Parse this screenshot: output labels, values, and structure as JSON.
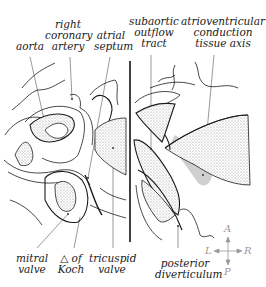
{
  "figure": {
    "type": "anatomical-diagram",
    "labels": [
      {
        "id": "aorta",
        "text": "aorta"
      },
      {
        "id": "right-coronary-artery",
        "text": "right\ncoronary\nartery"
      },
      {
        "id": "atrial-septum",
        "text": "atrial\nseptum"
      },
      {
        "id": "subaortic-outflow-tract",
        "text": "subaortic\noutflow\ntract"
      },
      {
        "id": "av-conduction-tissue-axis",
        "text": "atrioventricular\nconduction\ntissue axis"
      },
      {
        "id": "mitral-valve",
        "text": "mitral\nvalve"
      },
      {
        "id": "triangle-of-koch",
        "text": "△ of\nKoch"
      },
      {
        "id": "tricuspid-valve",
        "text": "tricuspid\nvalve"
      },
      {
        "id": "posterior-diverticulum",
        "text": "posterior\ndiverticulum"
      }
    ],
    "compass": {
      "anterior": "A",
      "posterior": "P",
      "left": "L",
      "right": "R"
    },
    "colors": {
      "line": "#1a1a1a",
      "leader": "#555555",
      "stipple": "#bdbdbd",
      "conduction_axis": "#cfcfcf",
      "compass": "#9a9a9a"
    }
  }
}
